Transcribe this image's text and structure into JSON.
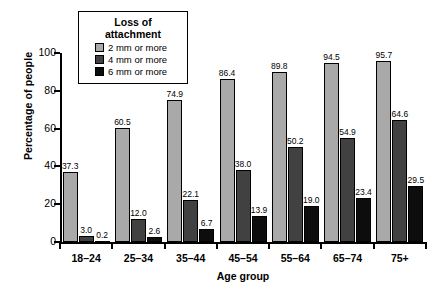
{
  "chart_data": {
    "type": "bar",
    "title": "",
    "xlabel": "Age group",
    "ylabel": "Percentage of people",
    "categories": [
      "18–24",
      "25–34",
      "35–44",
      "45–54",
      "55–64",
      "65–74",
      "75+"
    ],
    "series": [
      {
        "name": "2 mm or more",
        "color": "#a9a9a9",
        "values": [
          37.3,
          60.5,
          74.9,
          86.4,
          89.8,
          94.5,
          95.7
        ]
      },
      {
        "name": "4 mm or more",
        "color": "#414141",
        "values": [
          3.0,
          12.0,
          22.1,
          38.0,
          50.2,
          54.9,
          64.6
        ]
      },
      {
        "name": "6 mm or more",
        "color": "#0d0d0d",
        "values": [
          0.2,
          2.6,
          6.7,
          13.9,
          19.0,
          23.4,
          29.5
        ]
      }
    ],
    "value_labels": [
      [
        "37.3",
        "3.0",
        "0.2"
      ],
      [
        "60.5",
        "12.0",
        "2.6"
      ],
      [
        "74.9",
        "22.1",
        "6.7"
      ],
      [
        "86.4",
        "38.0",
        "13.9"
      ],
      [
        "89.8",
        "50.2",
        "19.0"
      ],
      [
        "94.5",
        "54.9",
        "23.4"
      ],
      [
        "95.7",
        "64.6",
        "29.5"
      ]
    ],
    "yticks": [
      0,
      20,
      40,
      60,
      80,
      100
    ],
    "ytick_labels": [
      "0",
      "20",
      "40",
      "60",
      "80",
      "100"
    ],
    "ylim": [
      0,
      100
    ],
    "grid": false,
    "legend": {
      "title": "Loss of attachment",
      "position": "top-left-inside",
      "entries": [
        "2 mm or more",
        "4 mm or more",
        "6 mm or more"
      ]
    }
  }
}
